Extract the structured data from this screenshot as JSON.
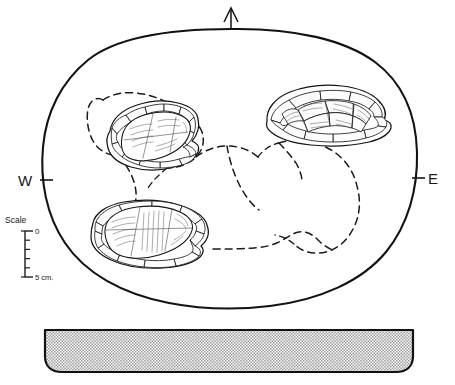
{
  "figure": {
    "type": "archaeological-site-plan",
    "title": "",
    "orientation": {
      "north_arrow": "north-arrow",
      "west_label": "W",
      "east_label": "E"
    },
    "scale_bar": {
      "title": "Scale",
      "top_label": "0",
      "bottom_label": "5 cm.",
      "divisions": 5
    },
    "plan": {
      "outline_name": "feature-outline-oval",
      "stone_features": [
        {
          "id": "stone-basin-upper-left",
          "label": "",
          "description": "cobble-lined basin"
        },
        {
          "id": "stone-cluster-upper-right",
          "label": "",
          "description": "cobble cluster"
        },
        {
          "id": "stone-basin-lower-left",
          "label": "",
          "description": "cobble-lined basin"
        }
      ],
      "dashed_outlines": [
        {
          "id": "dashed-pit-left",
          "label": ""
        },
        {
          "id": "dashed-pit-center",
          "label": ""
        },
        {
          "id": "dashed-pit-right",
          "label": ""
        },
        {
          "id": "dashed-pit-lower",
          "label": ""
        }
      ]
    },
    "section": {
      "id": "cross-section-profile",
      "label": "",
      "fill_pattern": "stipple"
    },
    "colors": {
      "ink": "#121212",
      "paper": "#ffffff",
      "stipple": "#8d8d8d"
    }
  }
}
